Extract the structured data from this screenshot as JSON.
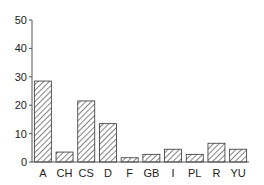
{
  "chart_data": {
    "type": "bar",
    "title": "",
    "xlabel": "",
    "ylabel": "",
    "categories": [
      "A",
      "CH",
      "CS",
      "D",
      "F",
      "GB",
      "I",
      "PL",
      "R",
      "YU"
    ],
    "values": [
      28.5,
      3.5,
      21.5,
      13.5,
      1.5,
      2.7,
      4.5,
      2.7,
      6.6,
      4.5
    ],
    "ylim": [
      0,
      50
    ],
    "yticks": [
      0,
      10,
      20,
      30,
      40,
      50
    ],
    "grid": false,
    "legend": null,
    "bar_fill": "diagonal-hatch",
    "colors": {
      "stroke": "#333333",
      "hatch": "#333333",
      "background": "#ffffff"
    }
  }
}
